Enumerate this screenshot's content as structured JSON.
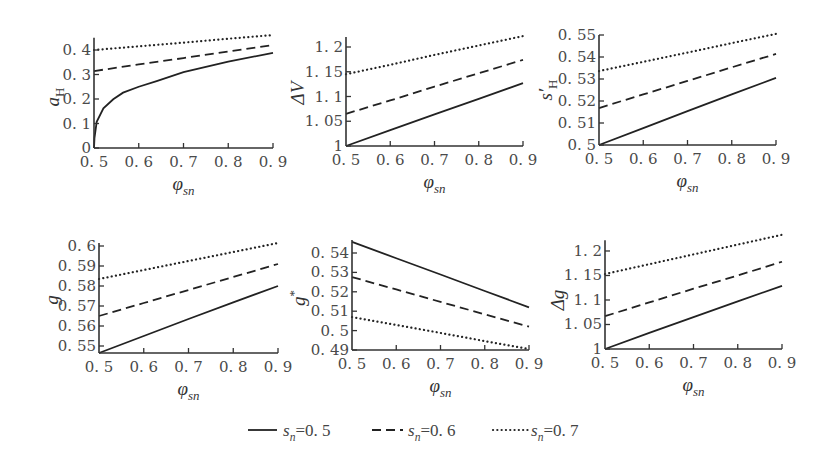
{
  "colors": {
    "line": "#222222",
    "axis": "#333333",
    "text": "#4a4a4a",
    "background": "#ffffff"
  },
  "legend": {
    "items": [
      {
        "style": "solid",
        "label": [
          {
            "text": "s",
            "italic": true
          },
          {
            "text": "n",
            "italic": true,
            "script": "sub"
          },
          {
            "text": "=0. 5"
          }
        ]
      },
      {
        "style": "dashed",
        "label": [
          {
            "text": "s",
            "italic": true
          },
          {
            "text": "n",
            "italic": true,
            "script": "sub"
          },
          {
            "text": "=0. 6"
          }
        ]
      },
      {
        "style": "dotted",
        "label": [
          {
            "text": "s",
            "italic": true
          },
          {
            "text": "n",
            "italic": true,
            "script": "sub"
          },
          {
            "text": "=0. 7"
          }
        ]
      }
    ]
  },
  "chart_data": [
    {
      "type": "line",
      "title": "",
      "ylabel": [
        {
          "text": "a",
          "italic": true
        },
        {
          "text": "H",
          "script": "sub"
        }
      ],
      "xlabel": [
        {
          "text": "φ",
          "italic": true
        },
        {
          "text": "sn",
          "italic": true,
          "script": "sub"
        }
      ],
      "xlim": [
        0.5,
        0.9
      ],
      "ylim": [
        0,
        0.45
      ],
      "grid": false,
      "xticks": [
        0.5,
        0.6,
        0.7,
        0.8,
        0.9
      ],
      "xtick_labels": [
        "0. 5",
        "0. 6",
        "0. 7",
        "0. 8",
        "0. 9"
      ],
      "yticks": [
        0,
        0.1,
        0.2,
        0.3,
        0.4
      ],
      "ytick_labels": [
        "0",
        "0. 1",
        "0. 2",
        "0. 3",
        "0. 4"
      ],
      "series": [
        {
          "name": "s_n=0.5",
          "style": "solid",
          "x": [
            0.5,
            0.501,
            0.506,
            0.521,
            0.543,
            0.565,
            0.6,
            0.64,
            0.7,
            0.8,
            0.9
          ],
          "y": [
            0.0,
            0.04,
            0.107,
            0.162,
            0.199,
            0.226,
            0.25,
            0.273,
            0.31,
            0.353,
            0.388
          ]
        },
        {
          "name": "s_n=0.6",
          "style": "dashed",
          "x": [
            0.5,
            0.6,
            0.7,
            0.8,
            0.9
          ],
          "y": [
            0.314,
            0.341,
            0.367,
            0.394,
            0.42
          ]
        },
        {
          "name": "s_n=0.7",
          "style": "dotted",
          "x": [
            0.5,
            0.6,
            0.7,
            0.8,
            0.9
          ],
          "y": [
            0.4,
            0.415,
            0.43,
            0.446,
            0.461
          ]
        }
      ]
    },
    {
      "type": "line",
      "title": "",
      "ylabel": [
        {
          "text": "ΔV",
          "italic": true
        }
      ],
      "xlabel": [
        {
          "text": "φ",
          "italic": true
        },
        {
          "text": "sn",
          "italic": true,
          "script": "sub"
        }
      ],
      "xlim": [
        0.5,
        0.9
      ],
      "ylim": [
        1,
        1.22
      ],
      "grid": false,
      "xticks": [
        0.5,
        0.6,
        0.7,
        0.8,
        0.9
      ],
      "xtick_labels": [
        "0. 5",
        "0. 6",
        "0. 7",
        "0. 8",
        "0. 9"
      ],
      "yticks": [
        1,
        1.05,
        1.1,
        1.15,
        1.2
      ],
      "ytick_labels": [
        "1",
        "1. 05",
        "1. 1",
        "1. 15",
        "1. 2"
      ],
      "series": [
        {
          "name": "s_n=0.5",
          "style": "solid",
          "x": [
            0.5,
            0.6,
            0.7,
            0.8,
            0.9
          ],
          "y": [
            1.0,
            1.032,
            1.064,
            1.095,
            1.127
          ]
        },
        {
          "name": "s_n=0.6",
          "style": "dashed",
          "x": [
            0.5,
            0.6,
            0.7,
            0.8,
            0.9
          ],
          "y": [
            1.065,
            1.092,
            1.12,
            1.147,
            1.174
          ]
        },
        {
          "name": "s_n=0.7",
          "style": "dotted",
          "x": [
            0.5,
            0.6,
            0.7,
            0.8,
            0.9
          ],
          "y": [
            1.145,
            1.164,
            1.184,
            1.203,
            1.222
          ]
        }
      ]
    },
    {
      "type": "line",
      "title": "",
      "ylabel": [
        {
          "text": "s′",
          "italic": true
        },
        {
          "text": "H",
          "script": "sub"
        }
      ],
      "xlabel": [
        {
          "text": "φ",
          "italic": true
        },
        {
          "text": "sn",
          "italic": true,
          "script": "sub"
        }
      ],
      "xlim": [
        0.5,
        0.9
      ],
      "ylim": [
        0.5,
        0.55
      ],
      "grid": false,
      "xticks": [
        0.5,
        0.6,
        0.7,
        0.8,
        0.9
      ],
      "xtick_labels": [
        "0. 5",
        "0. 6",
        "0. 7",
        "0. 8",
        "0. 9"
      ],
      "yticks": [
        0.5,
        0.51,
        0.52,
        0.53,
        0.54,
        0.55
      ],
      "ytick_labels": [
        "0. 5",
        "0. 51",
        "0. 52",
        "0. 53",
        "0. 54",
        "0. 55"
      ],
      "series": [
        {
          "name": "s_n=0.5",
          "style": "solid",
          "x": [
            0.5,
            0.6,
            0.7,
            0.8,
            0.9
          ],
          "y": [
            0.5,
            0.5077,
            0.5154,
            0.523,
            0.5305
          ]
        },
        {
          "name": "s_n=0.6",
          "style": "dashed",
          "x": [
            0.5,
            0.6,
            0.7,
            0.8,
            0.9
          ],
          "y": [
            0.5168,
            0.523,
            0.5291,
            0.5353,
            0.5414
          ]
        },
        {
          "name": "s_n=0.7",
          "style": "dotted",
          "x": [
            0.5,
            0.6,
            0.7,
            0.8,
            0.9
          ],
          "y": [
            0.5336,
            0.5378,
            0.542,
            0.5463,
            0.5505
          ]
        }
      ]
    },
    {
      "type": "line",
      "title": "",
      "ylabel": [
        {
          "text": "g",
          "italic": true
        }
      ],
      "xlabel": [
        {
          "text": "φ",
          "italic": true
        },
        {
          "text": "sn",
          "italic": true,
          "script": "sub"
        }
      ],
      "xlim": [
        0.5,
        0.9
      ],
      "ylim": [
        0.5465,
        0.6015
      ],
      "grid": false,
      "xticks": [
        0.5,
        0.6,
        0.7,
        0.8,
        0.9
      ],
      "xtick_labels": [
        "0. 5",
        "0. 6",
        "0. 7",
        "0. 8",
        "0. 9"
      ],
      "yticks": [
        0.55,
        0.56,
        0.57,
        0.58,
        0.59,
        0.6
      ],
      "ytick_labels": [
        "0. 55",
        "0. 56",
        "0. 57",
        "0. 58",
        "0. 59",
        "0. 6"
      ],
      "series": [
        {
          "name": "s_n=0.5",
          "style": "solid",
          "x": [
            0.5,
            0.6,
            0.7,
            0.8,
            0.9
          ],
          "y": [
            0.5465,
            0.555,
            0.5635,
            0.5718,
            0.58
          ]
        },
        {
          "name": "s_n=0.6",
          "style": "dashed",
          "x": [
            0.5,
            0.6,
            0.7,
            0.8,
            0.9
          ],
          "y": [
            0.565,
            0.5715,
            0.578,
            0.5845,
            0.591
          ]
        },
        {
          "name": "s_n=0.7",
          "style": "dotted",
          "x": [
            0.5,
            0.6,
            0.7,
            0.8,
            0.9
          ],
          "y": [
            0.5835,
            0.588,
            0.5925,
            0.597,
            0.6015
          ]
        }
      ]
    },
    {
      "type": "line",
      "title": "",
      "ylabel": [
        {
          "text": "g",
          "italic": true
        },
        {
          "text": "*",
          "script": "sup"
        }
      ],
      "xlabel": [
        {
          "text": "φ",
          "italic": true
        },
        {
          "text": "sn",
          "italic": true,
          "script": "sub"
        }
      ],
      "xlim": [
        0.5,
        0.9
      ],
      "ylim": [
        0.49,
        0.5467
      ],
      "grid": false,
      "xticks": [
        0.5,
        0.6,
        0.7,
        0.8,
        0.9
      ],
      "xtick_labels": [
        "0. 5",
        "0. 6",
        "0. 7",
        "0. 8",
        "0. 9"
      ],
      "yticks": [
        0.49,
        0.5,
        0.51,
        0.52,
        0.53,
        0.54
      ],
      "ytick_labels": [
        "0. 49",
        "0. 5",
        "0. 51",
        "0. 52",
        "0. 53",
        "0. 54"
      ],
      "series": [
        {
          "name": "s_n=0.5",
          "style": "solid",
          "x": [
            0.5,
            0.6,
            0.7,
            0.8,
            0.9
          ],
          "y": [
            0.5457,
            0.5373,
            0.5289,
            0.5204,
            0.512
          ]
        },
        {
          "name": "s_n=0.6",
          "style": "dashed",
          "x": [
            0.5,
            0.6,
            0.7,
            0.8,
            0.9
          ],
          "y": [
            0.5276,
            0.5212,
            0.5148,
            0.5084,
            0.502
          ]
        },
        {
          "name": "s_n=0.7",
          "style": "dotted",
          "x": [
            0.5,
            0.6,
            0.7,
            0.8,
            0.9
          ],
          "y": [
            0.507,
            0.5029,
            0.4988,
            0.4946,
            0.4905
          ]
        }
      ]
    },
    {
      "type": "line",
      "title": "",
      "ylabel": [
        {
          "text": "Δg",
          "italic": true
        }
      ],
      "xlabel": [
        {
          "text": "φ",
          "italic": true
        },
        {
          "text": "sn",
          "italic": true,
          "script": "sub"
        }
      ],
      "xlim": [
        0.5,
        0.9
      ],
      "ylim": [
        1,
        1.222
      ],
      "grid": false,
      "xticks": [
        0.5,
        0.6,
        0.7,
        0.8,
        0.9
      ],
      "xtick_labels": [
        "0. 5",
        "0. 6",
        "0. 7",
        "0. 8",
        "0. 9"
      ],
      "yticks": [
        1,
        1.05,
        1.1,
        1.15,
        1.2
      ],
      "ytick_labels": [
        "1",
        "1. 05",
        "1. 1",
        "1. 15",
        "1. 2"
      ],
      "series": [
        {
          "name": "s_n=0.5",
          "style": "solid",
          "x": [
            0.5,
            0.6,
            0.7,
            0.8,
            0.9
          ],
          "y": [
            1.0,
            1.033,
            1.065,
            1.097,
            1.129
          ]
        },
        {
          "name": "s_n=0.6",
          "style": "dashed",
          "x": [
            0.5,
            0.6,
            0.7,
            0.8,
            0.9
          ],
          "y": [
            1.067,
            1.095,
            1.123,
            1.15,
            1.178
          ]
        },
        {
          "name": "s_n=0.7",
          "style": "dotted",
          "x": [
            0.5,
            0.6,
            0.7,
            0.8,
            0.9
          ],
          "y": [
            1.153,
            1.173,
            1.193,
            1.213,
            1.233
          ]
        }
      ]
    }
  ]
}
